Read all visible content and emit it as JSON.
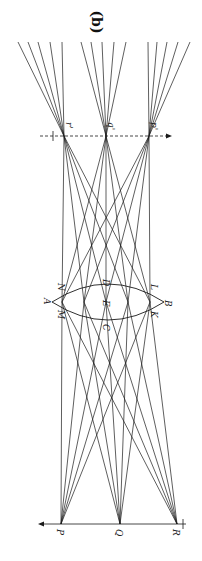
{
  "figure": {
    "panel_label": "(b)",
    "rotation_deg": 90,
    "object_points": [
      {
        "label": "P",
        "x": 61,
        "y": 524
      },
      {
        "label": "Q",
        "x": 120,
        "y": 524
      },
      {
        "label": "R",
        "x": 177,
        "y": 524
      }
    ],
    "image_points": [
      {
        "label": "r'",
        "x": 64,
        "y": 136
      },
      {
        "label": "q'",
        "x": 106,
        "y": 136
      },
      {
        "label": "p'",
        "x": 149,
        "y": 136
      }
    ],
    "lens": {
      "left_vertex": {
        "label": "A",
        "x": 52,
        "y": 302
      },
      "right_vertex": {
        "label": "B",
        "x": 164,
        "y": 302
      },
      "top_y": 284,
      "bottom_y": 320,
      "point_labels": [
        "N",
        "M",
        "D",
        "E",
        "C",
        "L",
        "K"
      ]
    },
    "lens_hits_x": [
      62,
      84,
      106,
      128,
      150
    ],
    "fan_top_y": 42,
    "fan_ends": {
      "r'": [
        18,
        28,
        38,
        50,
        62
      ],
      "q'": [
        81,
        91,
        102,
        114,
        126
      ],
      "p'": [
        148,
        157,
        167,
        178,
        190
      ]
    },
    "object_axis": {
      "y": 524,
      "x1": 38,
      "x2": 186,
      "arrow": "left"
    },
    "image_axis": {
      "y": 136,
      "x1": 40,
      "x2": 172,
      "arrow": "right",
      "style": "dashed"
    },
    "line_color": "#1a1a1a"
  }
}
